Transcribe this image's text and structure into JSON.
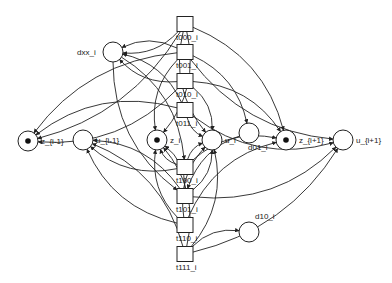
{
  "diagram": {
    "type": "petri-net",
    "places": [
      {
        "id": "z_im1",
        "label": "z_{i-1}",
        "x": 28,
        "y": 141,
        "tokens": 1
      },
      {
        "id": "u_im1",
        "label": "u_{i-1}",
        "x": 83,
        "y": 140,
        "tokens": 0
      },
      {
        "id": "z_i",
        "label": "z_i",
        "x": 157,
        "y": 140,
        "tokens": 1
      },
      {
        "id": "u_i",
        "label": "u_i",
        "x": 212,
        "y": 140,
        "tokens": 0
      },
      {
        "id": "d01_i",
        "label": "d01_i",
        "x": 249,
        "y": 133,
        "tokens": 0
      },
      {
        "id": "z_ip1",
        "label": "z_{i+1}",
        "x": 286,
        "y": 140,
        "tokens": 1
      },
      {
        "id": "u_ip1",
        "label": "u_{i+1}",
        "x": 343,
        "y": 140,
        "tokens": 0
      },
      {
        "id": "dxx_i",
        "label": "dxx_i",
        "x": 113,
        "y": 52,
        "tokens": 0
      },
      {
        "id": "d10_i",
        "label": "d10_i",
        "x": 249,
        "y": 232,
        "tokens": 0
      }
    ],
    "transitions": [
      {
        "id": "t000",
        "label": "t000_i",
        "x": 185,
        "y": 24
      },
      {
        "id": "t001",
        "label": "t001_i",
        "x": 185,
        "y": 52
      },
      {
        "id": "t010",
        "label": "t010_i",
        "x": 185,
        "y": 81
      },
      {
        "id": "t011",
        "label": "t011_i",
        "x": 185,
        "y": 110
      },
      {
        "id": "t100",
        "label": "t100_i",
        "x": 185,
        "y": 167
      },
      {
        "id": "t101",
        "label": "t101_i",
        "x": 185,
        "y": 196
      },
      {
        "id": "t110",
        "label": "t110_i",
        "x": 185,
        "y": 225
      },
      {
        "id": "t111",
        "label": "t111_i",
        "x": 185,
        "y": 254
      }
    ],
    "arcs": [
      [
        "t000",
        "z_im1"
      ],
      [
        "t001",
        "z_im1"
      ],
      [
        "t010",
        "z_im1"
      ],
      [
        "t011",
        "z_im1"
      ],
      [
        "t000",
        "dxx_i"
      ],
      [
        "t001",
        "dxx_i"
      ],
      [
        "t010",
        "dxx_i"
      ],
      [
        "t011",
        "dxx_i"
      ],
      [
        "t000",
        "z_i"
      ],
      [
        "t001",
        "z_i"
      ],
      [
        "t000",
        "z_ip1"
      ],
      [
        "t001",
        "u_ip1"
      ],
      [
        "t010",
        "u_i"
      ],
      [
        "t011",
        "u_i"
      ],
      [
        "t010",
        "z_ip1"
      ],
      [
        "t011",
        "u_ip1"
      ],
      [
        "t001",
        "d01_i"
      ],
      [
        "t000",
        "u_i"
      ],
      [
        "t100",
        "u_im1"
      ],
      [
        "t101",
        "u_im1"
      ],
      [
        "t110",
        "u_im1"
      ],
      [
        "t111",
        "u_im1"
      ],
      [
        "t100",
        "z_i"
      ],
      [
        "t101",
        "z_i"
      ],
      [
        "t110",
        "z_i"
      ],
      [
        "t111",
        "z_i"
      ],
      [
        "t100",
        "u_i"
      ],
      [
        "t101",
        "u_i"
      ],
      [
        "t110",
        "u_i"
      ],
      [
        "t111",
        "u_i"
      ],
      [
        "t100",
        "z_ip1"
      ],
      [
        "t101",
        "u_ip1"
      ],
      [
        "t110",
        "z_ip1"
      ],
      [
        "t111",
        "u_ip1"
      ],
      [
        "t111",
        "d10_i"
      ],
      [
        "d01_i",
        "t101"
      ],
      [
        "dxx_i",
        "t100"
      ],
      [
        "dxx_i",
        "t101"
      ]
    ]
  }
}
